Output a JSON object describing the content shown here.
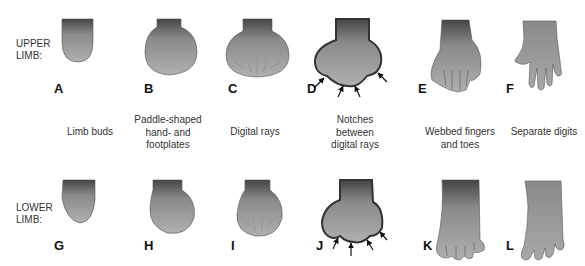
{
  "rows": [
    {
      "label_line1": "UPPER",
      "label_line2": "LIMB:"
    },
    {
      "label_line1": "LOWER",
      "label_line2": "LIMB:"
    }
  ],
  "upper_letters": [
    "A",
    "B",
    "C",
    "D",
    "E",
    "F"
  ],
  "lower_letters": [
    "G",
    "H",
    "I",
    "J",
    "K",
    "L"
  ],
  "stages": [
    {
      "line1": "Limb buds",
      "line2": "",
      "line3": ""
    },
    {
      "line1": "Paddle-shaped",
      "line2": "hand- and",
      "line3": "footplates"
    },
    {
      "line1": "Digital rays",
      "line2": "",
      "line3": ""
    },
    {
      "line1": "Notches",
      "line2": "between",
      "line3": "digital rays"
    },
    {
      "line1": "Webbed fingers",
      "line2": "and toes",
      "line3": ""
    },
    {
      "line1": "Separate digits",
      "line2": "",
      "line3": ""
    }
  ],
  "colors": {
    "shape_dark": "#4a4a4a",
    "shape_light": "#a8a8a8",
    "outline": "#3a3a3a"
  }
}
